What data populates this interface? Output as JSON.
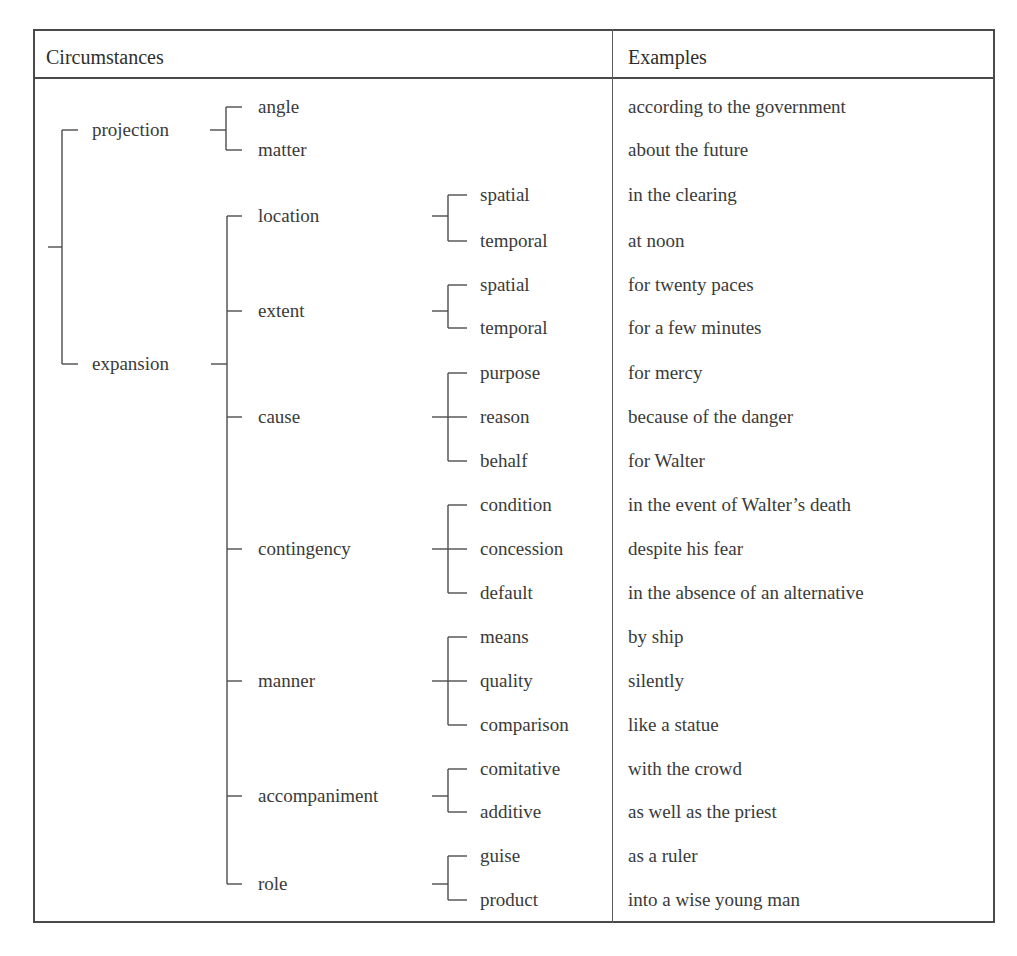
{
  "table": {
    "headers": {
      "circumstances": "Circumstances",
      "examples": "Examples"
    },
    "tree": {
      "level1": [
        {
          "label": "projection",
          "y": 130
        },
        {
          "label": "expansion",
          "y": 364
        }
      ],
      "projection_children": [
        {
          "label": "angle",
          "y": 107,
          "example": "according to the government"
        },
        {
          "label": "matter",
          "y": 150,
          "example": "about the future"
        }
      ],
      "expansion_children": [
        {
          "label": "location",
          "y": 216,
          "subtypes": [
            {
              "label": "spatial",
              "y": 195,
              "example": "in the clearing"
            },
            {
              "label": "temporal",
              "y": 241,
              "example": "at noon"
            }
          ]
        },
        {
          "label": "extent",
          "y": 311,
          "subtypes": [
            {
              "label": "spatial",
              "y": 285,
              "example": "for twenty paces"
            },
            {
              "label": "temporal",
              "y": 328,
              "example": "for a few minutes"
            }
          ]
        },
        {
          "label": "cause",
          "y": 417,
          "subtypes": [
            {
              "label": "purpose",
              "y": 373,
              "example": "for mercy"
            },
            {
              "label": "reason",
              "y": 417,
              "example": "because of the danger"
            },
            {
              "label": "behalf",
              "y": 461,
              "example": "for Walter"
            }
          ]
        },
        {
          "label": "contingency",
          "y": 549,
          "subtypes": [
            {
              "label": "condition",
              "y": 505,
              "example": "in the event of Walter’s death"
            },
            {
              "label": "concession",
              "y": 549,
              "example": "despite his fear"
            },
            {
              "label": "default",
              "y": 593,
              "example": "in the absence of an alternative"
            }
          ]
        },
        {
          "label": "manner",
          "y": 681,
          "subtypes": [
            {
              "label": "means",
              "y": 637,
              "example": "by ship"
            },
            {
              "label": "quality",
              "y": 681,
              "example": "silently"
            },
            {
              "label": "comparison",
              "y": 725,
              "example": "like a statue"
            }
          ]
        },
        {
          "label": "accompaniment",
          "y": 796,
          "subtypes": [
            {
              "label": "comitative",
              "y": 769,
              "example": "with the crowd"
            },
            {
              "label": "additive",
              "y": 812,
              "example": "as well as the priest"
            }
          ]
        },
        {
          "label": "role",
          "y": 884,
          "subtypes": [
            {
              "label": "guise",
              "y": 856,
              "example": "as a ruler"
            },
            {
              "label": "product",
              "y": 900,
              "example": "into a wise young man"
            }
          ]
        }
      ]
    }
  },
  "colors": {
    "line": "#4c4c4c",
    "text": "#3a3a3a",
    "background": "#ffffff"
  }
}
